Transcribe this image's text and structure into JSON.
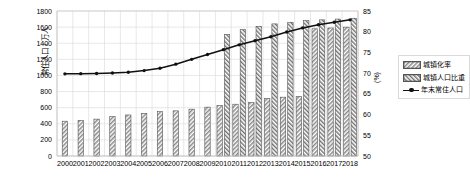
{
  "chart_data": {
    "type": "bar",
    "title": "",
    "xlabel": "",
    "ylabel": "常住人口 / 万人",
    "ylabel_right": "(%)",
    "ylim": [
      0,
      1800
    ],
    "ylim_right": [
      50,
      85
    ],
    "ytick_step": 200,
    "ytick_step_right": 5,
    "grid": true,
    "legend_position": "right",
    "categories": [
      "2000",
      "2001",
      "2002",
      "2003",
      "2004",
      "2005",
      "2006",
      "2007",
      "2008",
      "2009",
      "2010",
      "2011",
      "2012",
      "2013",
      "2014",
      "2015",
      "2016",
      "2017",
      "2018"
    ],
    "yticks_left": [
      "0",
      "200",
      "400",
      "600",
      "800",
      "1000",
      "1200",
      "1400",
      "1600",
      "1800"
    ],
    "yticks_right": [
      "50",
      "55",
      "60",
      "65",
      "70",
      "75",
      "80",
      "85"
    ],
    "series": [
      {
        "name": "城镇化率",
        "type": "bar",
        "axis": "right",
        "unit": "%",
        "values": [
          58.4,
          58.6,
          58.9,
          59.5,
          59.9,
          60.3,
          60.7,
          60.9,
          61.3,
          61.8,
          62.2,
          62.5,
          62.9,
          63.9,
          64.2,
          64.4,
          80.7,
          80.9,
          81.1
        ]
      },
      {
        "name": "城镇人口比重",
        "type": "bar",
        "axis": "left",
        "unit": "万人",
        "values": [
          null,
          null,
          null,
          null,
          null,
          null,
          null,
          null,
          null,
          null,
          1510,
          1570,
          1610,
          1640,
          1660,
          1680,
          1690,
          1700,
          1710
        ]
      },
      {
        "name": "年末常住人口",
        "type": "line",
        "axis": "left",
        "unit": "万人",
        "values": [
          1020,
          1022,
          1024,
          1030,
          1040,
          1060,
          1090,
          1140,
          1200,
          1260,
          1320,
          1380,
          1430,
          1480,
          1540,
          1590,
          1630,
          1660,
          1690
        ]
      }
    ],
    "colors": {
      "bar_hatch": "#7a7a7a",
      "bar_edge": "#555555",
      "line": "#111111",
      "grid": "#d9d9d9",
      "axis": "#bfbfbf",
      "text": "#000000"
    }
  }
}
